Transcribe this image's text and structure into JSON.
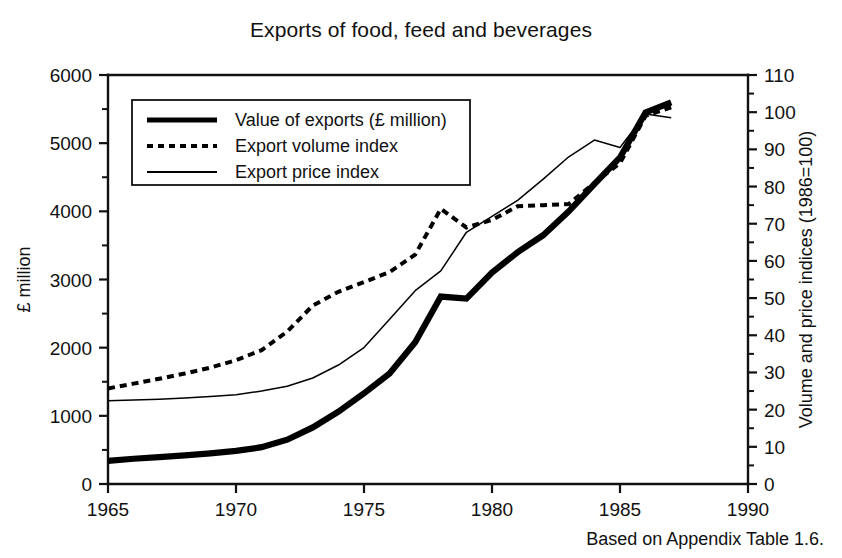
{
  "figure": {
    "title": "Exports of food, feed and beverages",
    "footnote": "Based on Appendix Table 1.6."
  },
  "legend": {
    "items": [
      {
        "label": "Value of exports (£ million)",
        "style": "thick-solid",
        "series": "value"
      },
      {
        "label": "Export volume index",
        "style": "dotted",
        "series": "volume"
      },
      {
        "label": "Export price index",
        "style": "thin-solid",
        "series": "price"
      }
    ]
  },
  "axes": {
    "x": {
      "label": "",
      "ticks": [
        "1965",
        "1970",
        "1975",
        "1980",
        "1985",
        "1990"
      ],
      "min": 1965,
      "max": 1990,
      "minor_step": 1
    },
    "y_left": {
      "label": "£ million",
      "ticks": [
        "0",
        "1000",
        "2000",
        "3000",
        "4000",
        "5000",
        "6000"
      ],
      "min": 0,
      "max": 6000,
      "minor_step": 500
    },
    "y_right": {
      "label": "Volume and price indices (1986=100)",
      "ticks": [
        "0",
        "10",
        "20",
        "30",
        "40",
        "50",
        "60",
        "70",
        "80",
        "90",
        "100",
        "110"
      ],
      "min": 0,
      "max": 110,
      "minor_step": 5
    }
  },
  "colors": {
    "ink": "#111111",
    "background": "#ffffff",
    "series": "#000000"
  },
  "chart_data": {
    "type": "line",
    "title": "Exports of food, feed and beverages",
    "xlabel": "",
    "ylabel": "£ million",
    "y2label": "Volume and price indices (1986=100)",
    "xlim": [
      1965,
      1990
    ],
    "ylim": [
      0,
      6000
    ],
    "y2lim": [
      0,
      110
    ],
    "grid": false,
    "legend_position": "upper-left-inside",
    "x": [
      1965,
      1966,
      1967,
      1968,
      1969,
      1970,
      1971,
      1972,
      1973,
      1974,
      1975,
      1976,
      1977,
      1978,
      1979,
      1980,
      1981,
      1982,
      1983,
      1984,
      1985,
      1986,
      1987
    ],
    "series": [
      {
        "name": "Value of exports (£ million)",
        "axis": "left",
        "units": "£ million",
        "values": [
          340,
          370,
          395,
          420,
          450,
          485,
          540,
          650,
          830,
          1060,
          1330,
          1620,
          2080,
          2750,
          2720,
          3100,
          3400,
          3650,
          4000,
          4400,
          4790,
          5450,
          5600
        ]
      },
      {
        "name": "Export volume index",
        "axis": "right",
        "units": "index 1986=100",
        "values": [
          25.7,
          27.0,
          28.3,
          29.7,
          31.3,
          33.3,
          36.0,
          41.0,
          48.0,
          51.7,
          54.3,
          57.0,
          61.7,
          74.0,
          69.0,
          71.0,
          74.7,
          75.0,
          75.3,
          81.0,
          86.3,
          99.0,
          101.3
        ]
      },
      {
        "name": "Export price index",
        "axis": "right",
        "units": "index 1986=100",
        "values": [
          22.4,
          22.6,
          22.8,
          23.1,
          23.5,
          24.0,
          25.0,
          26.3,
          28.5,
          32.0,
          36.7,
          44.3,
          52.0,
          57.3,
          67.7,
          72.0,
          76.3,
          82.0,
          88.0,
          92.5,
          90.5,
          99.5,
          98.5
        ]
      }
    ],
    "annotations": [
      {
        "text": "Value of exports plateaus 1978-1979 near £2,750m",
        "x": 1978.5,
        "y": 2750
      },
      {
        "text": "Export volume index peaks 1978 then falls back",
        "x": 1978,
        "y": 74
      },
      {
        "text": "Export price index peaks 1984 then dips in 1985",
        "x": 1984,
        "y": 92.5
      }
    ]
  }
}
